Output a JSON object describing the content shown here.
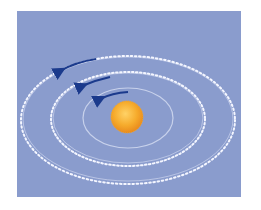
{
  "figure": {
    "colors": {
      "background": "#8a9ccd",
      "sun": "#f2a52a",
      "sun_highlight": "#ffd266",
      "orbit": "#f4f6ff",
      "arrow": "#1b3a8c"
    },
    "orbits": [
      {
        "name": "inner",
        "cx": 128,
        "cy": 118,
        "rx": 45,
        "ry": 30
      },
      {
        "name": "middle",
        "cx": 128,
        "cy": 118,
        "rx": 75,
        "ry": 45
      },
      {
        "name": "outer",
        "cx": 128,
        "cy": 118,
        "rx": 107,
        "ry": 63
      }
    ],
    "arrows": [
      {
        "orbit": "inner",
        "direction": "counter-clockwise"
      },
      {
        "orbit": "middle",
        "direction": "counter-clockwise"
      },
      {
        "orbit": "outer",
        "direction": "counter-clockwise"
      }
    ]
  }
}
